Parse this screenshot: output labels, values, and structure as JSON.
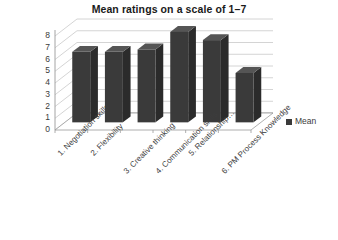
{
  "chart_data": {
    "type": "bar",
    "title": "Mean ratings on a scale of 1–7",
    "xlabel": "",
    "ylabel": "",
    "ylim": [
      0,
      8
    ],
    "ytick_step": 1,
    "yticks": [
      "8",
      "7",
      "6",
      "5",
      "4",
      "3",
      "2",
      "1",
      "0"
    ],
    "grid": true,
    "three_d": true,
    "legend_position": "right",
    "categories": [
      "1. Negotiation skills",
      "2. Flexibility",
      "3. Creative thinking",
      "4. Communication skills",
      "5. Relationship…",
      "6. PM Process Knowledge"
    ],
    "series": [
      {
        "name": "Mean",
        "values": [
          6.0,
          6.0,
          6.2,
          7.7,
          7.0,
          4.2
        ],
        "color": "#3a3a3a"
      }
    ]
  },
  "legend": {
    "entries": [
      {
        "label": "Mean",
        "color": "#3a3a3a",
        "marker": "square-marker"
      }
    ]
  },
  "colors": {
    "bar_front": "#3a3a3a",
    "bar_side": "#2b2b2b",
    "bar_top": "#555555",
    "grid": "#c9c9c9",
    "axis": "#9a9a9a",
    "floor": "#ffffff",
    "text": "#3b3b3b",
    "title": "#1a1a1a"
  }
}
